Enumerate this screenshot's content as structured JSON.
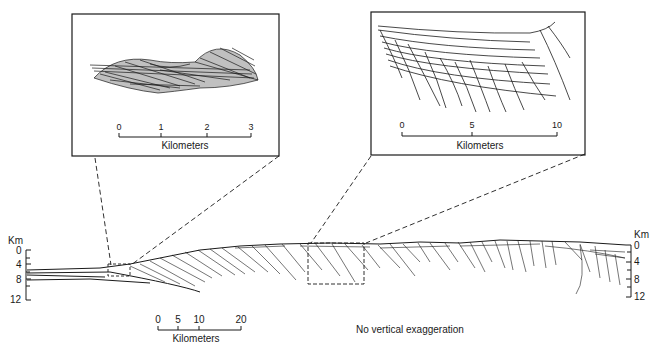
{
  "left_inset": {
    "scale_ticks": [
      "0",
      "1",
      "2",
      "3"
    ],
    "scale_unit": "Kilometers"
  },
  "right_inset": {
    "scale_ticks": [
      "0",
      "5",
      "10"
    ],
    "scale_unit": "Kilometers"
  },
  "main_section": {
    "left_axis": {
      "unit": "Km",
      "ticks": [
        "0",
        "4",
        "8",
        "12"
      ]
    },
    "right_axis": {
      "unit": "Km",
      "ticks": [
        "0",
        "4",
        "8",
        "12"
      ]
    },
    "scale_ticks": [
      "0",
      "5",
      "10",
      "20"
    ],
    "scale_unit": "Kilometers",
    "note": "No vertical exaggeration"
  }
}
